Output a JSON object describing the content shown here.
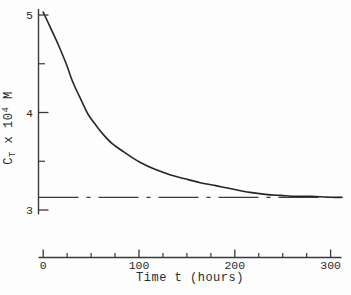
{
  "figure": {
    "background": "#fdfdfd",
    "axis_color": "#3a3a3a",
    "curve_color": "#262626",
    "text_color": "#2b2b2b"
  },
  "chart_data": {
    "type": "line",
    "title": "",
    "xlabel": "Time t (hours)",
    "ylabel": "C_T x 10^4 M",
    "ylabel_parts": [
      {
        "text": "C"
      },
      {
        "text": "T",
        "style": "sub"
      },
      {
        "text": " x 10"
      },
      {
        "text": "4",
        "style": "sup"
      },
      {
        "text": " M"
      }
    ],
    "x_ticks": [
      0,
      100,
      200,
      300
    ],
    "x_tick_labels": [
      "0",
      "100",
      "200",
      "300"
    ],
    "x_minor_step": 25,
    "x_range": [
      0,
      312
    ],
    "y_ticks": [
      5,
      4,
      3
    ],
    "y_tick_labels": [
      "5",
      "4",
      "3"
    ],
    "y_minor_ticks": [
      4.5,
      3.5
    ],
    "y_range_shown": [
      3,
      5
    ],
    "grid": false,
    "legend": "none",
    "series": [
      {
        "name": "total-concentration-decay-curve",
        "type": "curve",
        "x": [
          0,
          8,
          16,
          24,
          31,
          39,
          47,
          55,
          63,
          72,
          82,
          91,
          101,
          116,
          133,
          148,
          164,
          180,
          195,
          216,
          232,
          248,
          264,
          280,
          300,
          312
        ],
        "y": [
          5.03,
          4.86,
          4.69,
          4.5,
          4.31,
          4.14,
          3.98,
          3.87,
          3.77,
          3.68,
          3.61,
          3.55,
          3.49,
          3.42,
          3.36,
          3.32,
          3.28,
          3.25,
          3.22,
          3.18,
          3.16,
          3.15,
          3.14,
          3.14,
          3.13,
          3.13
        ]
      },
      {
        "name": "equilibrium-asymptote-line",
        "type": "dash-dot-horizontal",
        "value": 3.13
      }
    ]
  }
}
